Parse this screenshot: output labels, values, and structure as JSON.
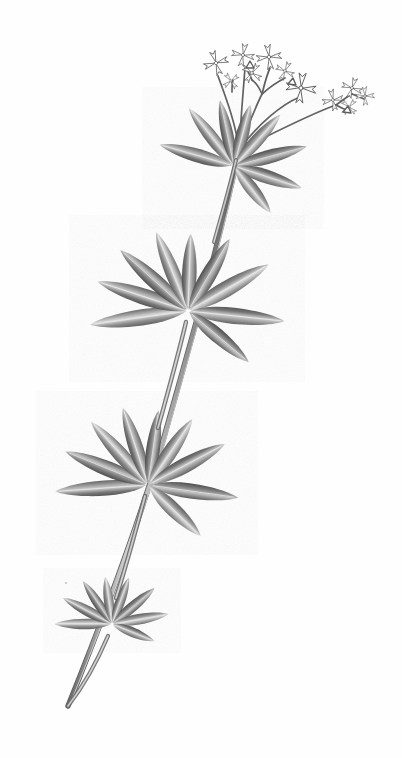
{
  "plate": {
    "title": "Botanical illustration of a whorled-leaf bedstraw plant",
    "subject": "Galium odoratum type herbaceous plant",
    "technique": "grayscale ink and wash engraving",
    "background_color": "#fefefe",
    "caption": ""
  },
  "palette": {
    "background": "#fefefe",
    "leaf_dark": "#4a4a4a",
    "leaf_mid": "#7d7d7d",
    "leaf_light": "#b9b9b9",
    "leaf_highlight": "#e2e2e2",
    "stem_dark": "#555555",
    "stem_light": "#a8a8a8",
    "flower_outline": "#5a5a5a",
    "flower_fill": "#ffffff",
    "midrib": "#8e8e8e"
  },
  "structure": {
    "stem": {
      "label": "main stem",
      "top_point": [
        239,
        150
      ],
      "bottom_point": [
        68,
        706
      ],
      "width": 4.5
    },
    "whorls": [
      {
        "label": "whorl-1-upper",
        "center": [
          234,
          166
        ],
        "leaf_count": 8,
        "leaf_length": 78,
        "leaf_width": 17,
        "angles": [
          196,
          232,
          258,
          285,
          312,
          345,
          18,
          52
        ]
      },
      {
        "label": "whorl-2-upper-middle",
        "center": [
          188,
          311
        ],
        "leaf_count": 9,
        "leaf_length": 98,
        "leaf_width": 20,
        "angles": [
          172,
          198,
          222,
          248,
          272,
          300,
          330,
          6,
          40
        ]
      },
      {
        "label": "whorl-3-lower-middle",
        "center": [
          148,
          485
        ],
        "leaf_count": 9,
        "leaf_length": 92,
        "leaf_width": 19,
        "angles": [
          176,
          202,
          228,
          252,
          278,
          304,
          332,
          8,
          44
        ]
      },
      {
        "label": "whorl-4-lower",
        "center": [
          112,
          624
        ],
        "leaf_count": 8,
        "leaf_length": 58,
        "leaf_width": 13,
        "angles": [
          180,
          208,
          236,
          262,
          290,
          320,
          350,
          22
        ]
      }
    ],
    "inflorescence": {
      "label": "flower cluster",
      "base_point": [
        239,
        150
      ],
      "flower_count": 11,
      "flower_description": "four-petaled star flowers with tubular throats",
      "flowers": [
        {
          "id": "fl-1",
          "center": [
            216,
            63
          ],
          "size": 13,
          "rotation": -18
        },
        {
          "id": "fl-2",
          "center": [
            243,
            55
          ],
          "size": 12,
          "rotation": 10
        },
        {
          "id": "fl-3",
          "center": [
            252,
            72
          ],
          "size": 11,
          "rotation": 32
        },
        {
          "id": "fl-4",
          "center": [
            269,
            57
          ],
          "size": 13,
          "rotation": -8
        },
        {
          "id": "fl-5",
          "center": [
            284,
            70
          ],
          "size": 10,
          "rotation": 24
        },
        {
          "id": "fl-6",
          "center": [
            300,
            89
          ],
          "size": 16,
          "rotation": 6
        },
        {
          "id": "fl-7",
          "center": [
            334,
            99
          ],
          "size": 11,
          "rotation": -12
        },
        {
          "id": "fl-8",
          "center": [
            352,
            88
          ],
          "size": 11,
          "rotation": 18
        },
        {
          "id": "fl-9",
          "center": [
            364,
            96
          ],
          "size": 10,
          "rotation": -4
        },
        {
          "id": "fl-10",
          "center": [
            348,
            106
          ],
          "size": 9,
          "rotation": 40
        },
        {
          "id": "fl-11",
          "center": [
            231,
            80
          ],
          "size": 9,
          "rotation": 52
        }
      ],
      "pedicels": [
        {
          "from": [
            239,
            150
          ],
          "to": [
            218,
            74
          ]
        },
        {
          "from": [
            239,
            150
          ],
          "to": [
            245,
            66
          ]
        },
        {
          "from": [
            239,
            150
          ],
          "to": [
            262,
            92
          ]
        },
        {
          "from": [
            262,
            92
          ],
          "to": [
            270,
            68
          ]
        },
        {
          "from": [
            262,
            92
          ],
          "to": [
            284,
            78
          ]
        },
        {
          "from": [
            239,
            150
          ],
          "to": [
            300,
            96
          ]
        },
        {
          "from": [
            262,
            92
          ],
          "to": [
            252,
            80
          ]
        },
        {
          "from": [
            239,
            150
          ],
          "to": [
            335,
            104
          ]
        },
        {
          "from": [
            335,
            104
          ],
          "to": [
            352,
            94
          ]
        },
        {
          "from": [
            335,
            104
          ],
          "to": [
            349,
            110
          ]
        },
        {
          "from": [
            352,
            94
          ],
          "to": [
            364,
            99
          ]
        },
        {
          "from": [
            231,
            88
          ],
          "to": [
            233,
            80
          ]
        }
      ]
    }
  }
}
